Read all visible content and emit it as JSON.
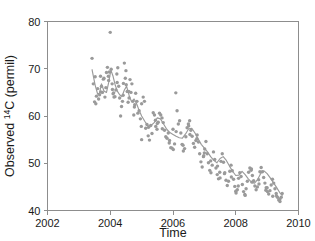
{
  "figure": {
    "top_cut_text": "",
    "background_color": "#ffffff",
    "marker_color": "#9a9a9a",
    "line_color": "#9a9a9a",
    "axis_color": "#8d8d8d"
  },
  "chart_data": {
    "type": "scatter",
    "title": "",
    "xlabel": "Time",
    "ylabel": "Observed  14C (permil)",
    "ylabel_prefix": "Observed  ",
    "ylabel_superscript": "14",
    "ylabel_suffix": "C (permil)",
    "xlim": [
      2002,
      2010
    ],
    "ylim": [
      40,
      80
    ],
    "xticks": [
      2002,
      2004,
      2006,
      2008,
      2010
    ],
    "xticklabels": [
      "2002",
      "2004",
      "2006",
      "2008",
      "2010"
    ],
    "yticks": [
      40,
      50,
      60,
      70,
      80
    ],
    "yticklabels": [
      "40",
      "50",
      "60",
      "70",
      "80"
    ],
    "grid": false,
    "legend": false,
    "frame": "box",
    "series": [
      {
        "name": "Observations",
        "marker": "circle",
        "x": [
          2003.42,
          2003.46,
          2003.5,
          2003.54,
          2003.56,
          2003.6,
          2003.63,
          2003.66,
          2003.69,
          2003.72,
          2003.75,
          2003.78,
          2003.8,
          2003.83,
          2003.86,
          2003.88,
          2003.91,
          2003.94,
          2003.97,
          2004.0,
          2004.03,
          2004.06,
          2004.09,
          2004.12,
          2004.15,
          2004.18,
          2004.21,
          2004.24,
          2004.27,
          2004.3,
          2004.33,
          2004.36,
          2004.39,
          2004.42,
          2004.45,
          2004.48,
          2004.51,
          2004.54,
          2004.57,
          2004.6,
          2004.63,
          2004.66,
          2004.69,
          2004.72,
          2004.75,
          2004.78,
          2004.81,
          2004.85,
          2004.88,
          2004.92,
          2004.96,
          2005.0,
          2005.05,
          2005.09,
          2005.13,
          2005.17,
          2005.21,
          2005.25,
          2005.29,
          2005.33,
          2005.37,
          2005.41,
          2005.45,
          2005.49,
          2005.53,
          2005.57,
          2005.61,
          2005.65,
          2005.69,
          2005.73,
          2005.77,
          2005.81,
          2005.85,
          2005.89,
          2005.93,
          2005.97,
          2006.01,
          2006.05,
          2006.09,
          2006.13,
          2006.17,
          2006.21,
          2006.25,
          2006.29,
          2006.33,
          2006.37,
          2006.41,
          2006.45,
          2006.49,
          2006.53,
          2006.57,
          2006.61,
          2006.65,
          2006.69,
          2006.73,
          2006.77,
          2006.81,
          2006.85,
          2006.89,
          2006.93,
          2006.97,
          2007.01,
          2007.05,
          2007.09,
          2007.13,
          2007.17,
          2007.21,
          2007.25,
          2007.29,
          2007.33,
          2007.37,
          2007.41,
          2007.45,
          2007.49,
          2007.53,
          2007.57,
          2007.61,
          2007.65,
          2007.69,
          2007.73,
          2007.77,
          2007.81,
          2007.85,
          2007.89,
          2007.93,
          2007.97,
          2008.01,
          2008.05,
          2008.09,
          2008.13,
          2008.17,
          2008.21,
          2008.25,
          2008.29,
          2008.33,
          2008.37,
          2008.41,
          2008.45,
          2008.49,
          2008.53,
          2008.57,
          2008.61,
          2008.65,
          2008.69,
          2008.73,
          2008.77,
          2008.81,
          2008.85,
          2008.89,
          2008.93,
          2008.97,
          2009.01,
          2009.05,
          2009.09,
          2009.13,
          2009.17,
          2009.21,
          2009.25,
          2009.29,
          2009.33,
          2009.37,
          2009.41,
          2009.45,
          2009.48,
          2003.52,
          2003.7,
          2003.95,
          2004.07,
          2004.22,
          2004.41,
          2004.59,
          2004.77,
          2004.99,
          2005.22,
          2005.44,
          2005.66,
          2005.88,
          2006.1,
          2006.32,
          2006.54,
          2006.76,
          2006.98,
          2007.2,
          2007.42,
          2007.64,
          2007.86,
          2008.08,
          2008.3,
          2008.52,
          2008.74,
          2008.96,
          2009.18,
          2009.4,
          2004.11,
          2004.5,
          2005.0,
          2005.5,
          2006.0,
          2006.5,
          2007.0,
          2007.5,
          2008.0,
          2008.5,
          2009.0,
          2009.3
        ],
        "y": [
          72.2,
          66.8,
          63.0,
          62.6,
          64.2,
          65.8,
          63.6,
          64.5,
          68.4,
          66.3,
          65.0,
          67.8,
          68.0,
          64.0,
          66.0,
          69.2,
          70.3,
          68.4,
          69.3,
          77.7,
          69.9,
          66.8,
          64.7,
          64.0,
          64.1,
          65.5,
          68.9,
          70.2,
          66.3,
          63.8,
          60.0,
          62.0,
          63.1,
          66.9,
          71.2,
          68.0,
          66.6,
          65.2,
          62.9,
          63.8,
          67.7,
          65.0,
          66.8,
          63.1,
          60.2,
          62.4,
          64.8,
          63.1,
          60.6,
          61.1,
          59.4,
          62.6,
          64.0,
          63.1,
          57.4,
          58.2,
          55.8,
          54.9,
          58.0,
          56.3,
          60.7,
          60.2,
          57.8,
          57.2,
          58.7,
          60.6,
          60.2,
          59.6,
          58.6,
          57.0,
          55.6,
          55.3,
          56.4,
          54.8,
          53.3,
          53.2,
          52.9,
          54.1,
          64.9,
          61.1,
          58.3,
          59.0,
          56.4,
          54.0,
          52.6,
          53.1,
          55.6,
          57.5,
          58.3,
          59.0,
          57.0,
          55.7,
          54.2,
          53.4,
          54.8,
          56.0,
          54.5,
          52.0,
          50.3,
          49.2,
          51.4,
          53.0,
          54.6,
          52.0,
          50.1,
          48.5,
          48.0,
          49.6,
          52.4,
          50.8,
          49.0,
          47.6,
          46.7,
          48.1,
          50.4,
          52.0,
          50.2,
          48.0,
          46.4,
          45.3,
          46.2,
          48.3,
          49.6,
          48.4,
          46.6,
          45.1,
          43.7,
          44.4,
          46.8,
          48.0,
          47.2,
          45.5,
          44.0,
          43.4,
          44.6,
          46.2,
          48.1,
          49.0,
          48.5,
          47.4,
          46.3,
          45.2,
          44.4,
          45.0,
          46.5,
          48.2,
          49.1,
          48.2,
          47.0,
          45.8,
          44.8,
          44.0,
          43.5,
          44.2,
          45.4,
          46.6,
          45.8,
          44.6,
          43.6,
          42.8,
          42.2,
          41.9,
          42.8,
          43.6,
          68.3,
          65.1,
          67.5,
          65.6,
          67.1,
          64.4,
          65.2,
          61.9,
          57.8,
          57.6,
          59.1,
          57.3,
          54.3,
          56.7,
          53.8,
          56.1,
          55.2,
          51.6,
          50.5,
          49.4,
          47.8,
          47.1,
          45.2,
          43.2,
          46.0,
          45.6,
          44.3,
          43.0,
          42.4,
          64.9,
          69.6,
          55.0,
          58.4,
          57.2,
          57.9,
          52.2,
          46.9,
          44.1,
          48.8,
          44.8,
          43.1
        ]
      }
    ],
    "trend_line": {
      "name": "Smoothed trend",
      "x": [
        2003.42,
        2003.52,
        2003.6,
        2003.66,
        2003.72,
        2003.8,
        2003.88,
        2003.95,
        2004.02,
        2004.09,
        2004.16,
        2004.23,
        2004.3,
        2004.37,
        2004.45,
        2004.52,
        2004.6,
        2004.68,
        2004.76,
        2004.84,
        2004.92,
        2005.0,
        2005.1,
        2005.2,
        2005.3,
        2005.4,
        2005.5,
        2005.6,
        2005.7,
        2005.8,
        2005.9,
        2006.0,
        2006.1,
        2006.2,
        2006.3,
        2006.4,
        2006.5,
        2006.6,
        2006.7,
        2006.8,
        2006.9,
        2007.0,
        2007.1,
        2007.2,
        2007.3,
        2007.4,
        2007.5,
        2007.6,
        2007.7,
        2007.8,
        2007.9,
        2008.0,
        2008.1,
        2008.2,
        2008.3,
        2008.4,
        2008.5,
        2008.6,
        2008.7,
        2008.8,
        2008.9,
        2009.0,
        2009.1,
        2009.2,
        2009.3,
        2009.4,
        2009.48
      ],
      "y": [
        69.8,
        66.5,
        64.6,
        64.9,
        66.8,
        65.3,
        65.0,
        67.1,
        69.7,
        68.4,
        66.5,
        65.2,
        64.5,
        64.1,
        65.5,
        66.3,
        64.4,
        63.0,
        63.6,
        62.6,
        61.2,
        60.0,
        58.9,
        57.9,
        58.0,
        58.6,
        59.6,
        59.4,
        58.3,
        57.2,
        56.5,
        56.1,
        55.7,
        55.4,
        55.3,
        56.2,
        57.3,
        57.4,
        56.4,
        55.2,
        54.0,
        53.2,
        52.4,
        51.4,
        50.6,
        50.1,
        51.0,
        51.4,
        50.6,
        49.4,
        48.3,
        47.4,
        47.5,
        48.3,
        47.6,
        46.7,
        46.0,
        45.8,
        46.6,
        47.9,
        48.4,
        47.8,
        46.9,
        45.9,
        44.9,
        43.8,
        43.2
      ]
    }
  }
}
